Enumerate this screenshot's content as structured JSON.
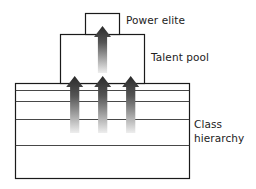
{
  "diagram": {
    "title": "",
    "labels": {
      "power_elite": "Power elite",
      "talent_pool": "Talent pool",
      "class_hierarchy_line1": "Class",
      "class_hierarchy_line2": "hierarchy"
    },
    "nodes": [
      {
        "id": "power-elite",
        "label": "Power elite",
        "shape": "rectangle",
        "level": 3
      },
      {
        "id": "talent-pool",
        "label": "Talent pool",
        "shape": "rectangle",
        "level": 2
      },
      {
        "id": "class-hierarchy",
        "label": "Class hierarchy",
        "shape": "layered-rectangle",
        "level": 1,
        "layers": 5
      }
    ],
    "edges": [
      {
        "from": "class-hierarchy",
        "to": "talent-pool",
        "type": "upward-gradient-arrow",
        "count": 3
      },
      {
        "from": "talent-pool",
        "to": "power-elite",
        "type": "upward-gradient-arrow",
        "count": 1
      }
    ],
    "colors": {
      "stroke": "#1a1a1a",
      "arrow_dark": "#2a2a2a",
      "arrow_light": "#e8e8e8",
      "background": "#ffffff"
    }
  }
}
